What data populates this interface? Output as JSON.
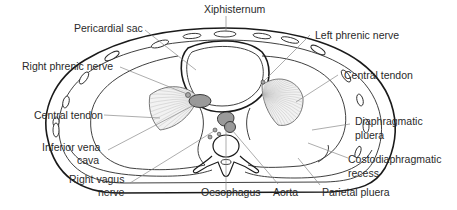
{
  "figure": {
    "labels": {
      "xiphisternum": "Xiphisternum",
      "pericardial_sac": "Pericardial sac",
      "left_phrenic_nerve": "Left phrenic nerve",
      "right_phrenic_nerve": "Right phrenic nerve",
      "central_tendon_right": "Central tendon",
      "central_tendon_left": "Central tendon",
      "inferior_vena_cava_1": "Inferior vena",
      "inferior_vena_cava_2": "cava",
      "right_vagus_nerve_1": "Right vagus",
      "right_vagus_nerve_2": "nerve",
      "diaphragmatic_pleura_1": "Diaphragmatic",
      "diaphragmatic_pleura_2": "pluera",
      "costodiaphragmatic_recess_1": "Costodiaphragmatic",
      "costodiaphragmatic_recess_2": "recess",
      "oesophagus": "Oesophagus",
      "aorta": "Aorta",
      "parietal_pleura": "Parietal pluera"
    },
    "colors": {
      "line": "#1a1a1a",
      "leader": "#8a8a8a",
      "vessel_fill": "#9a9a9a",
      "background": "#ffffff"
    }
  }
}
